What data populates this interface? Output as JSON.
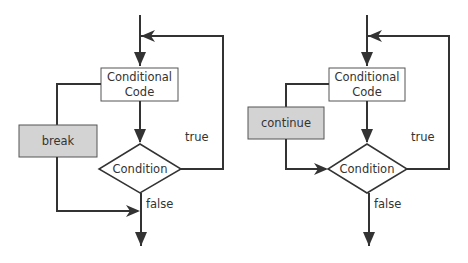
{
  "diagrams": [
    {
      "name": "break-flow",
      "code_box": {
        "line1": "Conditional",
        "line2": "Code"
      },
      "jump_box": {
        "label": "break"
      },
      "condition": {
        "label": "Condition"
      },
      "true_label": "true",
      "false_label": "false"
    },
    {
      "name": "continue-flow",
      "code_box": {
        "line1": "Conditional",
        "line2": "Code"
      },
      "jump_box": {
        "label": "continue"
      },
      "condition": {
        "label": "Condition"
      },
      "true_label": "true",
      "false_label": "false"
    }
  ],
  "colors": {
    "line": "#333333",
    "jump_box_fill": "#d3d3d3",
    "box_fill": "#ffffff"
  }
}
